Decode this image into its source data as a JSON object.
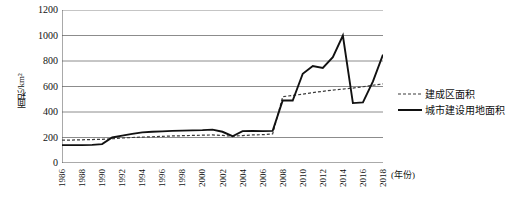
{
  "chart_data": {
    "type": "line",
    "title": "",
    "xlabel": "(年份)",
    "ylabel": "面积/km²",
    "ylim": [
      0,
      1200
    ],
    "yticks": [
      0,
      200,
      400,
      600,
      800,
      1000,
      1200
    ],
    "grid": true,
    "legend_position": "right",
    "xlim": [
      1986,
      2018
    ],
    "x": [
      1986,
      1987,
      1988,
      1989,
      1990,
      1991,
      1992,
      1993,
      1994,
      1995,
      1996,
      1997,
      1998,
      1999,
      2000,
      2001,
      2002,
      2003,
      2004,
      2005,
      2006,
      2007,
      2008,
      2009,
      2010,
      2011,
      2012,
      2013,
      2014,
      2015,
      2016,
      2017,
      2018
    ],
    "xtick_labels": [
      "1986",
      "1988",
      "1990",
      "1992",
      "1994",
      "1996",
      "1998",
      "2000",
      "2002",
      "2004",
      "2006",
      "2008",
      "2010",
      "2012",
      "2014",
      "2016",
      "2018"
    ],
    "series": [
      {
        "name": "建成区面积",
        "style": "dashed",
        "color": "#3a3a3a",
        "values": [
          180,
          180,
          182,
          184,
          186,
          190,
          196,
          200,
          203,
          206,
          209,
          212,
          214,
          216,
          218,
          220,
          216,
          210,
          215,
          220,
          222,
          228,
          520,
          530,
          540,
          552,
          562,
          572,
          580,
          588,
          598,
          610,
          620
        ]
      },
      {
        "name": "城市建设用地面积",
        "style": "solid",
        "color": "#111111",
        "values": [
          140,
          140,
          140,
          142,
          148,
          200,
          215,
          228,
          240,
          245,
          248,
          252,
          254,
          256,
          258,
          262,
          245,
          210,
          250,
          252,
          250,
          252,
          490,
          490,
          700,
          760,
          745,
          830,
          1000,
          470,
          475,
          640,
          850
        ]
      }
    ]
  },
  "legend": {
    "items": [
      {
        "label": "建成区面积",
        "style": "dashed"
      },
      {
        "label": "城市建设用地面积",
        "style": "solid"
      }
    ]
  },
  "axes": {
    "y_title": "面积/km²",
    "x_title": "(年份)",
    "y_tick_labels": [
      "0",
      "200",
      "400",
      "600",
      "800",
      "1000",
      "1200"
    ]
  }
}
